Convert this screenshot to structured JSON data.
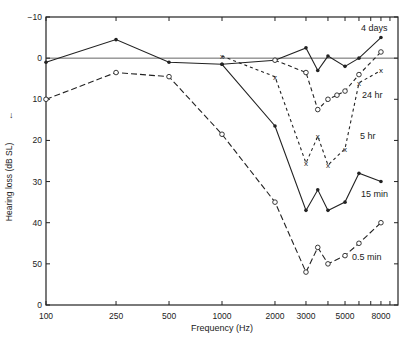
{
  "chart_data": {
    "type": "line",
    "title": "",
    "xlabel": "Frequency (Hz)",
    "ylabel": "Hearing loss (dB SL)",
    "xscale": "log",
    "xlim": [
      100,
      10000
    ],
    "ylim": [
      -10,
      60
    ],
    "y_inverted": true,
    "grid": false,
    "x_tick_labels": [
      "100",
      "250",
      "500",
      "1000",
      "2000",
      "3000",
      "5000",
      "8000"
    ],
    "x_tick_values": [
      100,
      250,
      500,
      1000,
      2000,
      3000,
      4000,
      5000,
      6000,
      7000,
      8000,
      9000
    ],
    "y_tick_labels": [
      "-10",
      "0",
      "10",
      "20",
      "30",
      "40",
      "50",
      "0"
    ],
    "y_tick_values": [
      -10,
      0,
      10,
      20,
      30,
      40,
      50,
      60
    ],
    "reference_line": 0,
    "series": [
      {
        "name": "4 days",
        "style": "solid",
        "marker": "dot",
        "x": [
          100,
          250,
          500,
          1000,
          2000,
          3000,
          3500,
          4000,
          5000,
          6000,
          8000
        ],
        "y": [
          1,
          -4.5,
          1,
          1.5,
          0.5,
          -2.5,
          3,
          -0.5,
          2,
          0,
          -5
        ]
      },
      {
        "name": "24 hr",
        "style": "dashed-short",
        "marker": "circle",
        "x": [
          2000,
          3000,
          3500,
          4000,
          4500,
          5000,
          6000,
          8000
        ],
        "y": [
          0.5,
          3.5,
          12.5,
          10,
          9,
          8,
          4,
          -1.5
        ]
      },
      {
        "name": "5 hr",
        "style": "dotted-dash",
        "marker": "x",
        "x": [
          1000,
          2000,
          3000,
          3500,
          4000,
          5000,
          6000,
          8000
        ],
        "y": [
          -0.5,
          4.5,
          25.5,
          19,
          26,
          22,
          6,
          3
        ]
      },
      {
        "name": "15 min",
        "style": "solid",
        "marker": "dot",
        "x": [
          1000,
          2000,
          3000,
          3500,
          4000,
          5000,
          6000,
          8000
        ],
        "y": [
          1.5,
          16.5,
          37,
          32,
          37,
          35,
          28,
          30
        ]
      },
      {
        "name": "0.5 min",
        "style": "dashed-long",
        "marker": "circle",
        "x": [
          100,
          250,
          500,
          1000,
          2000,
          3000,
          3500,
          4000,
          5000,
          6000,
          8000
        ],
        "y": [
          10,
          3.5,
          4.5,
          18.5,
          35,
          52,
          46,
          50,
          48,
          45,
          40
        ]
      }
    ],
    "annotations": [
      "4 days",
      "24 hr",
      "5 hr",
      "15 min",
      "0.5 min"
    ]
  }
}
